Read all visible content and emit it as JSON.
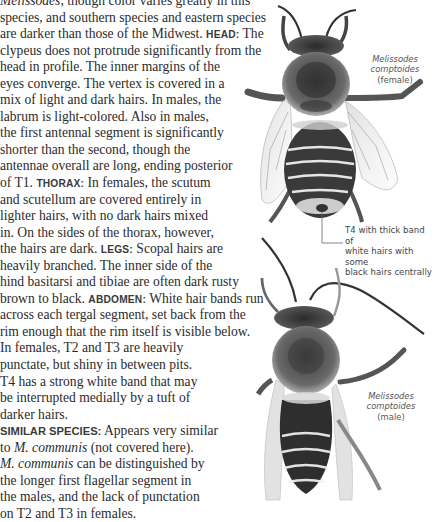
{
  "body_text": {
    "lines": [
      {
        "parts": [
          {
            "t": "Melissodes",
            "i": true
          },
          {
            "t": ", though color varies greatly in this"
          }
        ]
      },
      {
        "parts": [
          {
            "t": "species, and southern species and eastern species"
          }
        ]
      },
      {
        "parts": [
          {
            "t": "are darker than those of the Midwest. "
          },
          {
            "t": "HEAD:",
            "h": true
          },
          {
            "t": " The"
          }
        ]
      },
      {
        "parts": [
          {
            "t": "clypeus does not protrude significantly from the"
          }
        ]
      },
      {
        "parts": [
          {
            "t": "head in profile. The inner margins of the"
          }
        ]
      },
      {
        "parts": [
          {
            "t": "eyes converge. The vertex is covered in a"
          }
        ]
      },
      {
        "parts": [
          {
            "t": "mix of light and dark hairs. In males, the"
          }
        ]
      },
      {
        "parts": [
          {
            "t": "labrum is light-colored. Also in males,"
          }
        ]
      },
      {
        "parts": [
          {
            "t": "the first antennal segment is significantly"
          }
        ]
      },
      {
        "parts": [
          {
            "t": "shorter than the second, though the"
          }
        ]
      },
      {
        "parts": [
          {
            "t": "antennae overall are long, ending posterior"
          }
        ]
      },
      {
        "parts": [
          {
            "t": "of T1. "
          },
          {
            "t": "THORAX:",
            "h": true
          },
          {
            "t": " In females, the scutum"
          }
        ]
      },
      {
        "parts": [
          {
            "t": "and scutellum are covered entirely in"
          }
        ]
      },
      {
        "parts": [
          {
            "t": "lighter hairs, with no dark hairs mixed"
          }
        ]
      },
      {
        "parts": [
          {
            "t": "in. On the sides of the thorax, however,"
          }
        ]
      },
      {
        "parts": [
          {
            "t": "the hairs are dark. "
          },
          {
            "t": "LEGS:",
            "h": true
          },
          {
            "t": " Scopal hairs are"
          }
        ]
      },
      {
        "parts": [
          {
            "t": "heavily branched. The inner side of the"
          }
        ]
      },
      {
        "parts": [
          {
            "t": "hind basitarsi and tibiae are often dark rusty"
          }
        ]
      },
      {
        "parts": [
          {
            "t": "brown to black. "
          },
          {
            "t": "ABDOMEN:",
            "h": true
          },
          {
            "t": " White hair bands run"
          }
        ]
      },
      {
        "parts": [
          {
            "t": "across each tergal segment, set back from the"
          }
        ]
      },
      {
        "parts": [
          {
            "t": "rim enough that the rim itself is visible below."
          }
        ]
      },
      {
        "parts": [
          {
            "t": "In females, T2 and T3 are heavily"
          }
        ]
      },
      {
        "parts": [
          {
            "t": "punctate, but shiny in between pits."
          }
        ]
      },
      {
        "parts": [
          {
            "t": "T4 has a strong white band that may"
          }
        ]
      },
      {
        "parts": [
          {
            "t": "be interrupted medially by a tuft of"
          }
        ]
      },
      {
        "parts": [
          {
            "t": "darker hairs."
          }
        ]
      },
      {
        "parts": [
          {
            "t": "SIMILAR SPECIES:",
            "h2": true
          },
          {
            "t": " Appears very similar"
          }
        ]
      },
      {
        "parts": [
          {
            "t": "to "
          },
          {
            "t": "M. communis",
            "i": true
          },
          {
            "t": " (not covered here)."
          }
        ]
      },
      {
        "parts": [
          {
            "t": "M. communis",
            "i": true
          },
          {
            "t": " can be distinguished by"
          }
        ]
      },
      {
        "parts": [
          {
            "t": "the longer first flagellar segment in"
          }
        ]
      },
      {
        "parts": [
          {
            "t": "the males, and the lack of punctation"
          }
        ]
      },
      {
        "parts": [
          {
            "t": "on T2 and T3 in females."
          }
        ]
      }
    ]
  },
  "figures": {
    "female": {
      "genus": "Melissodes",
      "species": "comptoides",
      "sex": "(female)"
    },
    "annotation": {
      "lines": [
        "T4 with thick band of",
        "white hairs with some",
        "black hairs centrally"
      ]
    },
    "male": {
      "genus": "Melissodes",
      "species": "comptoides",
      "sex": "(male)"
    }
  },
  "colors": {
    "text": "#2b2b2b",
    "caption": "#555555",
    "leader_line": "#666666",
    "background": "#ffffff"
  }
}
